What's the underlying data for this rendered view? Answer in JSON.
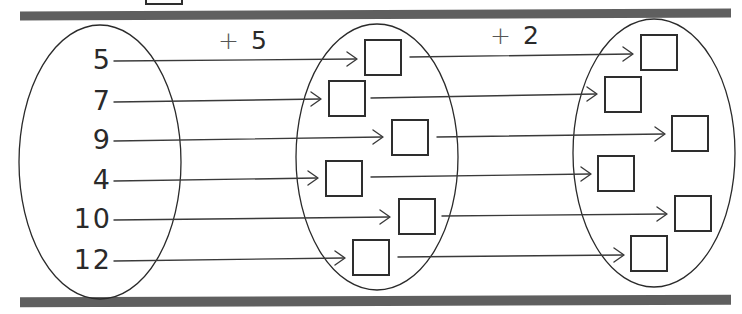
{
  "diagram": {
    "type": "mapping-worksheet",
    "operations": [
      {
        "label": "+ 5",
        "plus": "+",
        "value": "5"
      },
      {
        "label": "+ 2",
        "plus": "+",
        "value": "2"
      }
    ],
    "inputs": [
      "5",
      "7",
      "9",
      "4",
      "10",
      "12"
    ],
    "first_answers": [
      "",
      "",
      "",
      "",
      "",
      ""
    ],
    "second_answers": [
      "",
      "",
      "",
      "",
      "",
      ""
    ],
    "colors": {
      "ink": "#2a2a2a",
      "bar": "#5f5f5f",
      "background": "#ffffff"
    }
  }
}
